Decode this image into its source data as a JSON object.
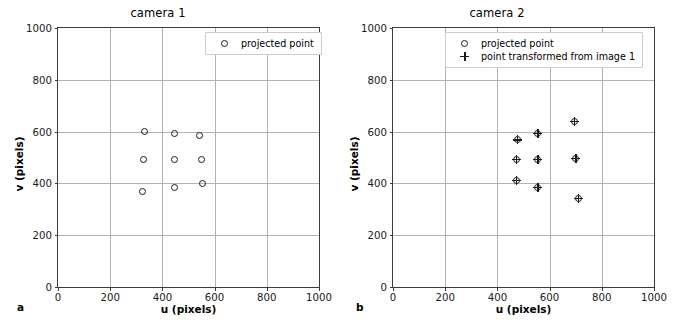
{
  "figure": {
    "width": 675,
    "height": 324,
    "background": "#ffffff",
    "marker_color": "#1a1a1a",
    "grid_color": "#b2b2b2",
    "axis_color": "#3b3b3b"
  },
  "panels": [
    {
      "letter": "a",
      "title": "camera 1",
      "xlabel": "u (pixels)",
      "ylabel": "v (pixels)",
      "xticks": [
        "0",
        "200",
        "400",
        "600",
        "800",
        "1000"
      ],
      "yticks": [
        "0",
        "200",
        "400",
        "600",
        "800",
        "1000"
      ],
      "legend": [
        {
          "marker": "circle-marker",
          "label": "projected point"
        }
      ]
    },
    {
      "letter": "b",
      "title": "camera 2",
      "xlabel": "u (pixels)",
      "ylabel": "v (pixels)",
      "xticks": [
        "0",
        "200",
        "400",
        "600",
        "800",
        "1000"
      ],
      "yticks": [
        "0",
        "200",
        "400",
        "600",
        "800",
        "1000"
      ],
      "legend": [
        {
          "marker": "circle-marker",
          "label": "projected point"
        },
        {
          "marker": "plus-marker",
          "label": "point transformed from image 1"
        }
      ]
    }
  ],
  "chart_data": [
    {
      "type": "scatter",
      "title": "camera 1",
      "xlabel": "u (pixels)",
      "ylabel": "v (pixels)",
      "xlim": [
        0,
        1000
      ],
      "ylim": [
        1000,
        0
      ],
      "xticks": [
        0,
        200,
        400,
        600,
        800,
        1000
      ],
      "yticks": [
        0,
        200,
        400,
        600,
        800,
        1000
      ],
      "grid": true,
      "y_axis_inverted": true,
      "legend_position": "upper right",
      "series": [
        {
          "name": "projected point",
          "marker": "o",
          "points": [
            {
              "u": 323,
              "v": 367
            },
            {
              "u": 448,
              "v": 383
            },
            {
              "u": 555,
              "v": 398
            },
            {
              "u": 326,
              "v": 491
            },
            {
              "u": 448,
              "v": 493
            },
            {
              "u": 549,
              "v": 493
            },
            {
              "u": 331,
              "v": 601
            },
            {
              "u": 446,
              "v": 591
            },
            {
              "u": 542,
              "v": 584
            }
          ]
        }
      ]
    },
    {
      "type": "scatter",
      "title": "camera 2",
      "xlabel": "u (pixels)",
      "ylabel": "v (pixels)",
      "xlim": [
        0,
        1000
      ],
      "ylim": [
        1000,
        0
      ],
      "xticks": [
        0,
        200,
        400,
        600,
        800,
        1000
      ],
      "yticks": [
        0,
        200,
        400,
        600,
        800,
        1000
      ],
      "grid": true,
      "y_axis_inverted": true,
      "legend_position": "upper center",
      "series": [
        {
          "name": "projected point",
          "marker": "o",
          "points": [
            {
              "u": 474,
              "v": 411
            },
            {
              "u": 555,
              "v": 383
            },
            {
              "u": 710,
              "v": 341
            },
            {
              "u": 474,
              "v": 493
            },
            {
              "u": 555,
              "v": 494
            },
            {
              "u": 701,
              "v": 495
            },
            {
              "u": 477,
              "v": 568
            },
            {
              "u": 555,
              "v": 592
            },
            {
              "u": 694,
              "v": 638
            }
          ]
        },
        {
          "name": "point transformed from image 1",
          "marker": "+",
          "points": [
            {
              "u": 474,
              "v": 411
            },
            {
              "u": 555,
              "v": 383
            },
            {
              "u": 710,
              "v": 341
            },
            {
              "u": 474,
              "v": 493
            },
            {
              "u": 555,
              "v": 494
            },
            {
              "u": 701,
              "v": 495
            },
            {
              "u": 477,
              "v": 568
            },
            {
              "u": 555,
              "v": 592
            },
            {
              "u": 694,
              "v": 638
            }
          ]
        }
      ]
    }
  ]
}
